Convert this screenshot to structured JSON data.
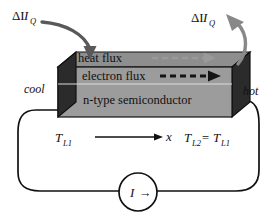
{
  "figure": {
    "type": "physics-schematic",
    "title_text": "",
    "background_color": "#ffffff",
    "labels": {
      "delta_heat_left": "ΔI",
      "delta_heat_left_sub": "Q",
      "delta_heat_right": "ΔI",
      "delta_heat_right_sub": "Q",
      "heat_flux": "heat flux",
      "electron_flux": "electron flux",
      "material": "n-type semiconductor",
      "cool": "cool",
      "hot": "hot",
      "temp_left": "T",
      "temp_left_sub": "L1",
      "axis": "x",
      "temp_right": "T",
      "temp_right_sub": "L2",
      "temp_right_eq": "=",
      "temp_right2": "T",
      "temp_right2_sub": "L1",
      "current": "I",
      "current_arrow": "→"
    },
    "icons": {
      "left_curved_arrow": "curved-arrow-down-icon",
      "right_curved_arrow": "curved-arrow-up-icon",
      "heat_flux_arrow": "dashed-arrow-right-icon",
      "electron_flux_arrow": "dashed-arrow-right-icon",
      "axis_arrow": "arrow-right-icon",
      "current_source": "current-source-icon"
    },
    "colors": {
      "block_front": "#9c9c9c",
      "block_top": "#8e8e8e",
      "block_endcap": "#2b2b2b",
      "block_outline": "#111111",
      "heat_arrow_gray": "#9a9a9a",
      "electron_arrow_black": "#141414",
      "wire": "#111111",
      "curved_arrow_left": "#595959",
      "curved_arrow_right": "#888888",
      "text": "#111111"
    },
    "geometry": {
      "block_left": 58,
      "block_right": 232,
      "block_top": 67,
      "block_bottom": 117,
      "depth_x": 18,
      "depth_y": -15,
      "source_circle_cx": 138,
      "source_circle_cy": 192,
      "source_circle_r": 19
    }
  }
}
